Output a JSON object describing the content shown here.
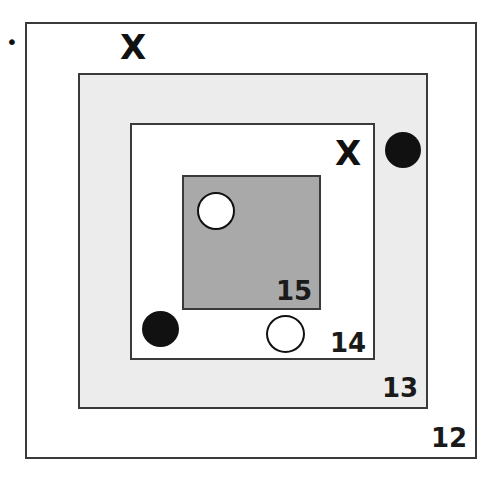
{
  "diagram": {
    "bullet": "•",
    "boxes": [
      {
        "label": "12",
        "fill": "#ffffff"
      },
      {
        "label": "13",
        "fill": "#ececec"
      },
      {
        "label": "14",
        "fill": "#ffffff"
      },
      {
        "label": "15",
        "fill": "#a9a9a9"
      }
    ],
    "markers": {
      "x_top": "X",
      "x_box14": "X"
    }
  }
}
